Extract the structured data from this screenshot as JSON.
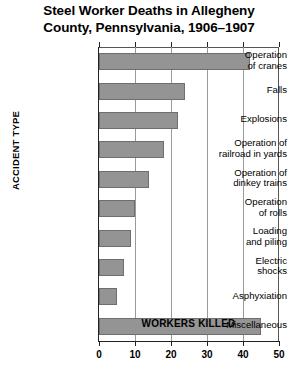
{
  "chart_data": {
    "type": "bar",
    "orientation": "horizontal",
    "title": "Steel Worker Deaths in Allegheny County, Pennsylvania, 1906–1907",
    "title_line1": "Steel Worker Deaths in Allegheny",
    "title_line2": "County, Pennsylvania, 1906–1907",
    "xlabel": "WORKERS KILLED",
    "ylabel": "ACCIDENT TYPE",
    "categories": [
      "Operation of cranes",
      "Falls",
      "Explosions",
      "Operation of railroad in yards",
      "Operation of dinkey trains",
      "Operation of rolls",
      "Loading and piling",
      "Electric shocks",
      "Asphyxiation",
      "Miscellaneous"
    ],
    "category_lines": [
      [
        "Operation",
        "of cranes"
      ],
      [
        "Falls"
      ],
      [
        "Explosions"
      ],
      [
        "Operation of",
        "railroad in yards"
      ],
      [
        "Operation of",
        "dinkey trains"
      ],
      [
        "Operation",
        "of rolls"
      ],
      [
        "Loading",
        "and piling"
      ],
      [
        "Electric",
        "shocks"
      ],
      [
        "Asphyxiation"
      ],
      [
        "Miscellaneous"
      ]
    ],
    "values": [
      42,
      24,
      22,
      18,
      14,
      10,
      9,
      7,
      5,
      45
    ],
    "xlim": [
      0,
      50
    ],
    "xticks": [
      0,
      10,
      20,
      30,
      40,
      50
    ],
    "xtick_labels": [
      "0",
      "10",
      "20",
      "30",
      "40",
      "50"
    ],
    "grid": true,
    "grid_axis": "x",
    "legend": false,
    "bar_color": "#949494",
    "bar_border_color": "#6e6e6e",
    "axis_color": "#222222",
    "gridline_color": "#9a9a9a",
    "background": "#ffffff"
  }
}
